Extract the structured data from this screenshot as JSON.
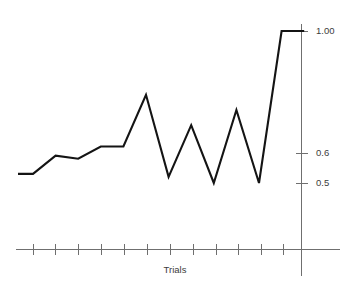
{
  "chart_data": {
    "type": "line",
    "title": "",
    "xlabel": "Trials",
    "ylabel": "",
    "grid": false,
    "legend": false,
    "x": [
      1,
      2,
      3,
      4,
      5,
      6,
      7,
      8,
      9,
      10,
      11,
      12,
      13,
      14
    ],
    "categories": [
      "1",
      "2",
      "3",
      "4",
      "5",
      "6",
      "7",
      "8",
      "9",
      "10",
      "11",
      "12",
      "13",
      "14"
    ],
    "values": [
      0.53,
      0.53,
      0.59,
      0.58,
      0.62,
      0.62,
      0.79,
      0.52,
      0.69,
      0.5,
      0.74,
      0.5,
      1.0,
      1.0
    ],
    "ytick_labels": [
      "1.00",
      "0.6",
      "0.5"
    ],
    "ytick_values": [
      1.0,
      0.6,
      0.5
    ],
    "ylim": [
      0.42,
      1.05
    ],
    "xlim": [
      0.5,
      14.5
    ],
    "n_xticks": 13,
    "line_color": "#141414",
    "axis_color": "#6f6f6f",
    "background": "#ffffff"
  },
  "labels": {
    "y_top": "1.00",
    "y_mid": "0.6",
    "y_low": "0.5",
    "x_axis_title": "Trials"
  }
}
